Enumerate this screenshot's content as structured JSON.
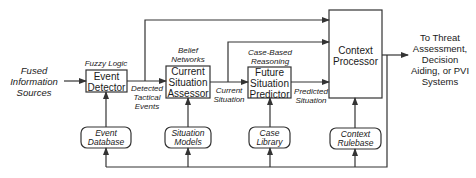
{
  "input": {
    "label": "Fused Information Sources"
  },
  "processes": [
    {
      "id": "event-detector",
      "label_l1": "Event",
      "label_l2": "Detector",
      "method": "Fuzzy Logic"
    },
    {
      "id": "current-situation-assessor",
      "label_l1": "Current",
      "label_l2": "Situation",
      "label_l3": "Assessor",
      "method_l1": "Belief",
      "method_l2": "Networks"
    },
    {
      "id": "future-situation-predictor",
      "label_l1": "Future",
      "label_l2": "Situation",
      "label_l3": "Predictor",
      "method_l1": "Case-Based",
      "method_l2": "Reasoning"
    },
    {
      "id": "context-processor",
      "label_l1": "Context",
      "label_l2": "Processor"
    }
  ],
  "flows": {
    "detected_l1": "Detected",
    "detected_l2": "Tactical",
    "detected_l3": "Events",
    "current_l1": "Current",
    "current_l2": "Situation",
    "predicted_l1": "Predicted",
    "predicted_l2": "Situation"
  },
  "stores": [
    {
      "id": "event-database",
      "l1": "Event",
      "l2": "Database"
    },
    {
      "id": "situation-models",
      "l1": "Situation",
      "l2": "Models"
    },
    {
      "id": "case-library",
      "l1": "Case",
      "l2": "Library"
    },
    {
      "id": "context-rulebase",
      "l1": "Context",
      "l2": "Rulebase"
    }
  ],
  "output": {
    "l1": "To Threat",
    "l2": "Assessment,",
    "l3": "Decision",
    "l4": "Aiding, or PVI",
    "l5": "Systems"
  },
  "colors": {
    "line": "#333333",
    "text": "#1a1a1a"
  }
}
